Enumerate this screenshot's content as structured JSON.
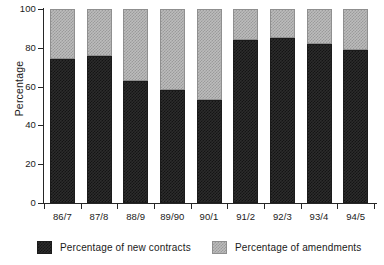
{
  "chart_data": {
    "type": "bar",
    "stacked": true,
    "title": "",
    "subtitle": "",
    "xlabel": "",
    "ylabel": "Percentage",
    "ylim": [
      0,
      100
    ],
    "yticks": [
      0,
      20,
      40,
      60,
      80,
      100
    ],
    "ytick_labels": [
      "0",
      "20",
      "40",
      "60",
      "80",
      "100"
    ],
    "grid": false,
    "legend_position": "bottom",
    "categories": [
      "86/7",
      "87/8",
      "88/9",
      "89/90",
      "90/1",
      "91/2",
      "92/3",
      "93/4",
      "94/5"
    ],
    "series": [
      {
        "name": "Percentage of new contracts",
        "color": "#2c2c2c",
        "pattern": "dark-checker",
        "values": [
          74,
          76,
          63,
          58,
          53,
          84,
          85,
          82,
          79
        ]
      },
      {
        "name": "Percentage of amendments",
        "color": "#bcbcbc",
        "pattern": "light-checker",
        "values": [
          26,
          24,
          37,
          42,
          47,
          16,
          15,
          18,
          21
        ]
      }
    ]
  },
  "axes": {
    "y_title": "Percentage",
    "y_tick_labels": [
      "100",
      "80",
      "60",
      "40",
      "20",
      "0"
    ],
    "x_tick_labels": [
      "86/7",
      "87/8",
      "88/9",
      "89/90",
      "90/1",
      "91/2",
      "92/3",
      "93/4",
      "94/5"
    ]
  },
  "legend": {
    "items": [
      {
        "label": "Percentage of new contracts",
        "swatch": "dark-checker-swatch"
      },
      {
        "label": "Percentage of amendments",
        "swatch": "light-checker-swatch"
      }
    ]
  }
}
